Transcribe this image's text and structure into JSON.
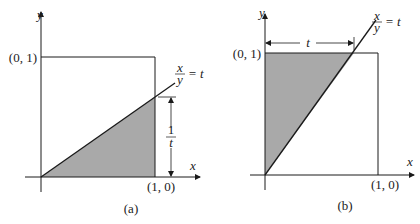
{
  "colors": {
    "shade": "#a9a9a9",
    "line": "#1a1a1a",
    "background": "#ffffff"
  },
  "panel_a": {
    "caption": "(a)",
    "axis_x_label": "x",
    "axis_y_label": "y",
    "point_top_label": "(0, 1)",
    "point_right_label": "(1, 0)",
    "line_label_num": "x",
    "line_label_den": "y",
    "line_label_rhs": "= t",
    "dimension_label_num": "1",
    "dimension_label_den": "t"
  },
  "panel_b": {
    "caption": "(b)",
    "axis_x_label": "x",
    "axis_y_label": "y",
    "point_top_label": "(0, 1)",
    "point_right_label": "(1, 0)",
    "line_label_num": "x",
    "line_label_den": "y",
    "line_label_rhs": "= t",
    "dimension_label": "t"
  }
}
